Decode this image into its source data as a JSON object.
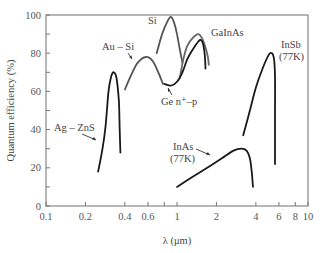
{
  "chart_data": {
    "type": "line",
    "title": "",
    "xlabel": "λ (μm)",
    "ylabel": "Quantum efficiency (%)",
    "xscale": "log",
    "xlim": [
      0.1,
      10
    ],
    "ylim": [
      0,
      100
    ],
    "grid": false,
    "legend": "inline labels",
    "x_ticks": [
      0.1,
      0.2,
      0.4,
      0.6,
      0.8,
      1,
      2,
      4,
      6,
      8,
      10
    ],
    "x_tick_labels": [
      "0.1",
      "0.2",
      "0.4",
      "0.6",
      "1",
      "2",
      "4",
      "6",
      "8",
      "10"
    ],
    "y_ticks": [
      0,
      10,
      20,
      30,
      40,
      50,
      60,
      70,
      80,
      90,
      100
    ],
    "y_tick_labels": [
      "0",
      "20",
      "40",
      "60",
      "80",
      "100"
    ],
    "series": [
      {
        "name": "Ag – ZnS",
        "color": "#1a1a1a",
        "points": [
          [
            0.25,
            18
          ],
          [
            0.27,
            30
          ],
          [
            0.285,
            42
          ],
          [
            0.3,
            60
          ],
          [
            0.315,
            68
          ],
          [
            0.33,
            70
          ],
          [
            0.345,
            67
          ],
          [
            0.36,
            55
          ],
          [
            0.365,
            40
          ],
          [
            0.37,
            28
          ]
        ]
      },
      {
        "name": "Au – Si",
        "color": "#555555",
        "points": [
          [
            0.4,
            61
          ],
          [
            0.45,
            69
          ],
          [
            0.5,
            75
          ],
          [
            0.58,
            78
          ],
          [
            0.65,
            76
          ],
          [
            0.72,
            70
          ],
          [
            0.78,
            64
          ]
        ]
      },
      {
        "name": "Si",
        "color": "#555555",
        "points": [
          [
            0.7,
            80
          ],
          [
            0.77,
            90
          ],
          [
            0.85,
            97
          ],
          [
            0.9,
            99
          ],
          [
            0.95,
            96
          ],
          [
            1.0,
            90
          ],
          [
            1.05,
            82
          ],
          [
            1.1,
            75
          ]
        ]
      },
      {
        "name": "GaInAs",
        "color": "#666666",
        "points": [
          [
            1.05,
            67
          ],
          [
            1.12,
            77
          ],
          [
            1.2,
            84
          ],
          [
            1.32,
            88
          ],
          [
            1.45,
            90
          ],
          [
            1.55,
            88
          ],
          [
            1.65,
            83
          ],
          [
            1.72,
            78
          ],
          [
            1.75,
            74
          ]
        ]
      },
      {
        "name": "Ge n⁺–p",
        "color": "#1a1a1a",
        "points": [
          [
            0.8,
            64
          ],
          [
            0.9,
            63
          ],
          [
            1.0,
            65
          ],
          [
            1.1,
            70
          ],
          [
            1.2,
            77
          ],
          [
            1.32,
            82
          ],
          [
            1.45,
            86
          ],
          [
            1.52,
            87
          ],
          [
            1.58,
            85
          ],
          [
            1.63,
            79
          ],
          [
            1.65,
            72
          ]
        ]
      },
      {
        "name": "InAs (77K)",
        "color": "#1a1a1a",
        "points": [
          [
            1.0,
            10
          ],
          [
            1.3,
            15
          ],
          [
            1.7,
            20
          ],
          [
            2.2,
            25
          ],
          [
            2.7,
            29
          ],
          [
            3.1,
            30
          ],
          [
            3.4,
            29
          ],
          [
            3.6,
            25
          ],
          [
            3.72,
            18
          ],
          [
            3.8,
            10
          ]
        ]
      },
      {
        "name": "InSb (77K)",
        "color": "#1a1a1a",
        "points": [
          [
            3.2,
            37
          ],
          [
            3.6,
            50
          ],
          [
            4.0,
            62
          ],
          [
            4.5,
            72
          ],
          [
            5.0,
            79
          ],
          [
            5.3,
            80
          ],
          [
            5.5,
            77
          ],
          [
            5.6,
            68
          ],
          [
            5.6,
            45
          ],
          [
            5.6,
            22
          ]
        ]
      }
    ]
  },
  "labels": {
    "ag_zns": "Ag – ZnS",
    "au_si": "Au – Si",
    "si": "Si",
    "gainas": "GaInAs",
    "ge": "Ge n⁺–p",
    "inas_1": "InAs",
    "inas_2": "(77K)",
    "insb_1": "InSb",
    "insb_2": "(77K)"
  }
}
